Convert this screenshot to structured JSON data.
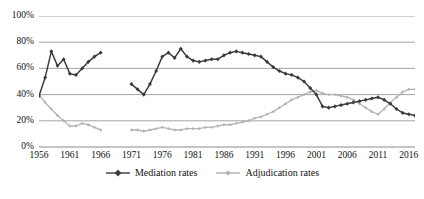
{
  "chart_data": {
    "type": "line",
    "title": "",
    "xlabel": "",
    "ylabel": "",
    "ylim": [
      0,
      100
    ],
    "xlim": [
      1956,
      2017
    ],
    "grid": true,
    "legend_position": "bottom-center",
    "y_ticks": [
      "0%",
      "20%",
      "40%",
      "60%",
      "80%",
      "100%"
    ],
    "y_tick_values": [
      0,
      20,
      40,
      60,
      80,
      100
    ],
    "x_ticks": [
      "1956",
      "1961",
      "1966",
      "1971",
      "1976",
      "1981",
      "1986",
      "1991",
      "1996",
      "2001",
      "2006",
      "2011",
      "2016"
    ],
    "x_tick_values": [
      1956,
      1961,
      1966,
      1971,
      1976,
      1981,
      1986,
      1991,
      1996,
      2001,
      2006,
      2011,
      2016
    ],
    "colors": {
      "mediation": "#3a3a3a",
      "adjudication": "#b4b4b4",
      "gridline": "#8c8c8c",
      "axis": "#5a5a5a",
      "background": "#ffffff",
      "text": "#111111"
    },
    "series": [
      {
        "name": "Mediation rates",
        "color": "#3a3a3a",
        "marker": "diamond",
        "segments": [
          {
            "x": [
              1956,
              1957,
              1958,
              1959,
              1960,
              1961,
              1962,
              1963,
              1964,
              1965,
              1966
            ],
            "values": [
              39,
              53,
              73,
              62,
              67,
              56,
              55,
              60,
              65,
              69,
              72
            ]
          },
          {
            "x": [
              1971,
              1972,
              1973,
              1974,
              1975,
              1976,
              1977,
              1978,
              1979,
              1980,
              1981,
              1982,
              1983,
              1984,
              1985,
              1986,
              1987,
              1988,
              1989,
              1990,
              1991,
              1992,
              1993,
              1994,
              1995,
              1996,
              1997,
              1998,
              1999,
              2000,
              2001,
              2002,
              2003,
              2004,
              2005,
              2006,
              2007,
              2008,
              2009,
              2010,
              2011,
              2012,
              2013,
              2014,
              2015,
              2016,
              2017
            ],
            "values": [
              48,
              44,
              40,
              48,
              58,
              69,
              72,
              68,
              75,
              69,
              66,
              65,
              66,
              67,
              67,
              70,
              72,
              73,
              72,
              71,
              70,
              69,
              65,
              61,
              58,
              56,
              55,
              53,
              50,
              45,
              40,
              31,
              30,
              31,
              32,
              33,
              34,
              35,
              36,
              37,
              38,
              36,
              33,
              29,
              26,
              25,
              24
            ]
          }
        ]
      },
      {
        "name": "Adjudication rates",
        "color": "#b4b4b4",
        "marker": "dot",
        "segments": [
          {
            "x": [
              1956,
              1957,
              1958,
              1959,
              1960,
              1961,
              1962,
              1963,
              1964,
              1965,
              1966
            ],
            "values": [
              40,
              34,
              29,
              24,
              20,
              16,
              16,
              18,
              17,
              15,
              13
            ]
          },
          {
            "x": [
              1971,
              1972,
              1973,
              1974,
              1975,
              1976,
              1977,
              1978,
              1979,
              1980,
              1981,
              1982,
              1983,
              1984,
              1985,
              1986,
              1987,
              1988,
              1989,
              1990,
              1991,
              1992,
              1993,
              1994,
              1995,
              1996,
              1997,
              1998,
              1999,
              2000,
              2001,
              2002,
              2003,
              2004,
              2005,
              2006,
              2007,
              2008,
              2009,
              2010,
              2011,
              2012,
              2013,
              2014,
              2015,
              2016,
              2017
            ],
            "values": [
              13,
              13,
              12,
              13,
              14,
              15,
              14,
              13,
              13,
              14,
              14,
              14,
              15,
              15,
              16,
              17,
              17,
              18,
              19,
              20,
              22,
              23,
              25,
              27,
              30,
              33,
              36,
              38,
              40,
              42,
              43,
              41,
              40,
              40,
              39,
              38,
              36,
              33,
              30,
              27,
              25,
              29,
              34,
              38,
              42,
              44,
              44
            ]
          }
        ]
      }
    ]
  },
  "legend": {
    "items": [
      {
        "label": "Mediation rates"
      },
      {
        "label": "Adjudication rates"
      }
    ]
  }
}
